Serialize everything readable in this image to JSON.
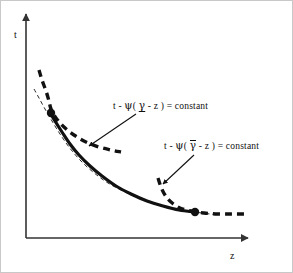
{
  "figure": {
    "title": "",
    "background_color": "#ffffff",
    "border_color": "#c8c8c8",
    "ink_color": "#111111",
    "width": 293,
    "height": 273
  },
  "axes": {
    "origin": {
      "x": 25,
      "y": 237
    },
    "y_axis": {
      "label": "t",
      "tip": {
        "x": 25,
        "y": 13
      }
    },
    "x_axis": {
      "label": "z",
      "tip": {
        "x": 247,
        "y": 237
      }
    }
  },
  "labels": {
    "y_axis_label": "t",
    "x_axis_label": "z",
    "equation_lower": {
      "prefix": "t - ",
      "psi": "ψ",
      "open": "( ",
      "gamma": "γ",
      "gamma_decoration": "underline",
      "minus_z": " - z ",
      "close": ")",
      "equals": " = constant",
      "full_text": "t - ψ( γ - z ) = constant"
    },
    "equation_upper": {
      "prefix": "t - ",
      "psi": "ψ",
      "open": "( ",
      "gamma": "γ",
      "gamma_decoration": "overbar",
      "minus_z": " - z ",
      "close": ")",
      "equals": " = constant",
      "full_text": "t - ψ( γ̄ - z ) = constant"
    }
  },
  "chart_data": {
    "type": "line",
    "title": "",
    "xlabel": "z",
    "ylabel": "t",
    "grid": false,
    "legend": null,
    "xlim": [
      25,
      247
    ],
    "ylim": [
      237,
      13
    ],
    "axes_style": "two-arrowed-half-axes",
    "annotations": [
      {
        "name": "equation-lower-branch",
        "text": "t - ψ( γ - z ) = constant",
        "text_x": 112,
        "text_y": 104,
        "arrow_from": {
          "x": 135,
          "y": 113
        },
        "arrow_to": {
          "x": 88,
          "y": 145
        }
      },
      {
        "name": "equation-upper-branch",
        "text": "t - ψ( γ̄ - z ) = constant",
        "text_x": 163,
        "text_y": 143,
        "arrow_from": {
          "x": 193,
          "y": 154
        },
        "arrow_to": {
          "x": 162,
          "y": 183
        }
      }
    ],
    "series": [
      {
        "name": "main-solid-curve",
        "style": "solid",
        "width": 3.2,
        "color": "#111111",
        "points": [
          [
            48,
            110
          ],
          [
            54,
            120
          ],
          [
            61,
            131
          ],
          [
            69,
            143
          ],
          [
            78,
            154
          ],
          [
            89,
            165
          ],
          [
            101,
            175
          ],
          [
            115,
            185
          ],
          [
            130,
            193
          ],
          [
            146,
            200
          ],
          [
            162,
            205
          ],
          [
            178,
            209
          ],
          [
            194,
            211
          ]
        ]
      },
      {
        "name": "main-thin-dashed-envelope",
        "style": "dashed-thin",
        "width": 0.9,
        "color": "#111111",
        "points": [
          [
            33,
            88
          ],
          [
            38,
            97
          ],
          [
            44,
            108
          ],
          [
            51,
            120
          ],
          [
            59,
            133
          ],
          [
            68,
            146
          ],
          [
            79,
            159
          ],
          [
            92,
            171
          ],
          [
            107,
            182
          ],
          [
            124,
            191
          ],
          [
            142,
            199
          ],
          [
            161,
            205
          ],
          [
            181,
            209
          ],
          [
            201,
            212
          ],
          [
            218,
            214
          ]
        ]
      },
      {
        "name": "lower-branch-thick-dashed",
        "style": "dashed-thick",
        "width": 3.4,
        "color": "#111111",
        "points": [
          [
            38,
            69
          ],
          [
            41,
            79
          ],
          [
            45,
            90
          ],
          [
            48,
            100
          ],
          [
            50,
            108
          ],
          [
            55,
            117
          ],
          [
            63,
            126
          ],
          [
            73,
            134
          ],
          [
            85,
            141
          ],
          [
            98,
            146
          ],
          [
            110,
            149
          ],
          [
            120,
            151
          ]
        ]
      },
      {
        "name": "upper-branch-thick-dashed",
        "style": "dashed-thick",
        "width": 3.4,
        "color": "#111111",
        "points": [
          [
            157,
            177
          ],
          [
            160,
            186
          ],
          [
            164,
            194
          ],
          [
            170,
            201
          ],
          [
            179,
            207
          ],
          [
            190,
            210
          ],
          [
            203,
            212
          ],
          [
            217,
            213
          ],
          [
            231,
            213
          ],
          [
            243,
            213
          ]
        ]
      }
    ],
    "markers": [
      {
        "name": "tangency-point-lower",
        "x": 50,
        "y": 112,
        "r": 4.2,
        "color": "#111111"
      },
      {
        "name": "tangency-point-upper",
        "x": 194,
        "y": 211,
        "r": 4.2,
        "color": "#111111"
      }
    ]
  }
}
